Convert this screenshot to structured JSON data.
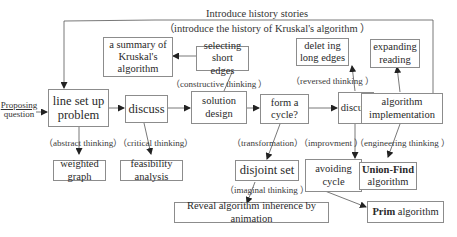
{
  "diagram": {
    "top_caption": {
      "line1": "Introduce history stories",
      "line2": "（introduce the history of Kruskal's algorithm ）"
    },
    "entry": {
      "line1": "Proposing",
      "line2": "question"
    },
    "nodes": {
      "line_set_up_problem": "line set up\nproblem",
      "discuss_1": "discuss",
      "solution_design": "solution\ndesign",
      "form_a_cycle": "form a\ncycle?",
      "discuss_2": "discuss",
      "algorithm_implementation": "algorithm\nimplementation",
      "summary_kruskal": "a summary of\nKruskal's\nalgorithm",
      "selecting_short_edges": "selecting\nshort edges",
      "deleting_long_edges": "delet ing\nlong edges",
      "expanding_reading": "expanding\nreading",
      "weighted_graph": "weighted\ngraph",
      "feasibility_analysis": "feasibility\nanalysis",
      "disjoint_set": "disjoint set",
      "avoiding_cycle": "avoiding\ncycle",
      "union_find_bold": "Union-Find",
      "union_find_rest": "algorithm",
      "reveal_animation": "Reveal algorithm inherence by animation",
      "prim_bold": "Prim",
      "prim_rest": " algorithm"
    },
    "edge_labels": {
      "constructive_thinking": "（constructive thinking ）",
      "reversed_thinking": "（reversed thinking ）",
      "abstract_thinking": "（abstract thinking）",
      "critical_thinking": "（critical thinking）",
      "transformation": "（transformation）",
      "improvement": "（improvment ）",
      "engineering_thinking": "（engineering thinking ）",
      "imaginal_thinking": "（imaginal thinking ）"
    },
    "colors": {
      "line": "#555555",
      "border": "#8c8c8c",
      "text": "#2a2a2a"
    }
  }
}
